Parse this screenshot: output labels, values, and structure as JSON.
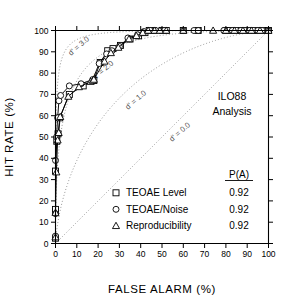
{
  "chart_data": {
    "type": "line",
    "title": "",
    "xlabel": "FALSE ALARM (%)",
    "ylabel": "HIT RATE (%)",
    "xlim": [
      0,
      100
    ],
    "ylim": [
      0,
      100
    ],
    "xticks": [
      0,
      10,
      20,
      30,
      40,
      50,
      60,
      70,
      80,
      90,
      100
    ],
    "yticks": [
      0,
      10,
      20,
      30,
      40,
      50,
      60,
      70,
      80,
      90,
      100
    ],
    "grid": false,
    "legend_position": "lower-right",
    "annotations": [
      {
        "name": "analysis-line1",
        "text": "ILO88"
      },
      {
        "name": "analysis-line2",
        "text": "Analysis"
      }
    ],
    "iso_curves": [
      {
        "label": "d' = 3.0",
        "dprime": 3.0
      },
      {
        "label": "d' = 2.0",
        "dprime": 2.0
      },
      {
        "label": "d' = 1.0",
        "dprime": 1.0
      },
      {
        "label": "d' = 0.0",
        "dprime": 0.0
      }
    ],
    "series": [
      {
        "name": "TEOAE Level",
        "marker": "square",
        "pa": "0.92",
        "x": [
          0,
          0,
          0,
          0,
          0.6,
          1.2,
          2.0,
          6.5,
          13.0,
          18.0,
          21.0,
          24.5,
          27.0,
          30.5,
          35.0,
          39.0,
          42.0,
          44.0,
          46.0,
          50.0,
          52.0,
          60.0,
          67.0,
          80.0,
          82.0,
          84.0,
          86.0,
          88.0,
          90.0,
          92.0,
          94.0,
          96.0,
          98.0,
          100.0
        ],
        "y": [
          2.5,
          15.0,
          16.0,
          34.0,
          48.0,
          51.5,
          59.0,
          70.0,
          74.0,
          76.5,
          85.0,
          90.5,
          91.5,
          93.0,
          96.0,
          97.5,
          99.0,
          100.0,
          100.0,
          100.0,
          100.0,
          100.0,
          100.0,
          100.0,
          100.0,
          100.0,
          100.0,
          100.0,
          100.0,
          100.0,
          100.0,
          100.0,
          100.0,
          100.0
        ]
      },
      {
        "name": "TEOAE/Noise",
        "marker": "circle",
        "pa": "0.92",
        "x": [
          0,
          0,
          0,
          0.5,
          1.0,
          1.6,
          2.4,
          6.5,
          12.0,
          17.5,
          20.5,
          24.0,
          26.5,
          30.0,
          34.0,
          38.5,
          41.5,
          44.5,
          47.0,
          51.0,
          60.0,
          65.0,
          67.0,
          79.0,
          83.0,
          85.0,
          87.0,
          89.0,
          91.0,
          93.0,
          95.0,
          97.0,
          100.0
        ],
        "y": [
          3.5,
          14.0,
          39.0,
          50.0,
          59.0,
          67.0,
          69.5,
          74.0,
          75.0,
          77.0,
          84.5,
          89.0,
          90.5,
          92.5,
          96.5,
          98.0,
          99.5,
          100.0,
          100.0,
          100.0,
          100.0,
          100.0,
          100.0,
          100.0,
          100.0,
          100.0,
          100.0,
          100.0,
          100.0,
          100.0,
          100.0,
          100.0,
          100.0
        ]
      },
      {
        "name": "Reproducibility",
        "marker": "triangle",
        "pa": "0.92",
        "x": [
          0,
          0,
          0.4,
          1.0,
          1.5,
          2.2,
          6.0,
          11.0,
          16.5,
          17.5,
          18.0,
          23.0,
          26.0,
          29.5,
          34.5,
          38.0,
          41.0,
          43.5,
          46.5,
          49.0,
          52.0,
          60.0,
          74.0,
          80.0,
          84.0,
          88.0,
          92.0,
          96.0,
          100.0
        ],
        "y": [
          3.0,
          14.5,
          33.5,
          48.5,
          52.0,
          59.5,
          69.0,
          73.5,
          76.0,
          76.5,
          77.0,
          85.5,
          89.5,
          92.0,
          96.0,
          97.5,
          99.0,
          100.0,
          100.0,
          100.0,
          100.0,
          100.0,
          100.0,
          100.0,
          100.0,
          100.0,
          100.0,
          100.0,
          100.0
        ]
      }
    ],
    "legend_header": "P(A)"
  },
  "colors": {
    "axis": "#000000",
    "iso": "#8a8a8a",
    "data": "#000000",
    "marker_fill": "#ffffff"
  }
}
